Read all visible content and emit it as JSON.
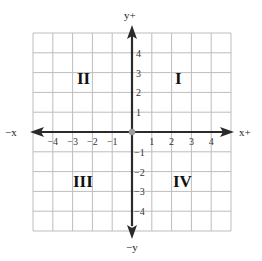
{
  "diagram": {
    "type": "coordinate-plane",
    "grid": {
      "min": -5,
      "max": 5,
      "cells": 10,
      "color": "#bdbdbd"
    },
    "axis_color": "#2b2b2b",
    "origin_color": "#9a9a9a",
    "axis_labels": {
      "x_positive": "x+",
      "x_negative": "−x",
      "y_positive": "y+",
      "y_negative": "−y"
    },
    "x_ticks": [
      {
        "value": -4,
        "label": "−4"
      },
      {
        "value": -3,
        "label": "−3"
      },
      {
        "value": -2,
        "label": "−2"
      },
      {
        "value": -1,
        "label": "−1"
      },
      {
        "value": 1,
        "label": "1"
      },
      {
        "value": 2,
        "label": "2"
      },
      {
        "value": 3,
        "label": "3"
      },
      {
        "value": 4,
        "label": "4"
      }
    ],
    "y_ticks": [
      {
        "value": 4,
        "label": "4"
      },
      {
        "value": 3,
        "label": "3"
      },
      {
        "value": 2,
        "label": "2"
      },
      {
        "value": 1,
        "label": "1"
      },
      {
        "value": -1,
        "label": "−1"
      },
      {
        "value": -2,
        "label": "−2"
      },
      {
        "value": -3,
        "label": "−3"
      },
      {
        "value": -4,
        "label": "−4"
      }
    ],
    "quadrants": [
      {
        "id": "I",
        "label": "I"
      },
      {
        "id": "II",
        "label": "II"
      },
      {
        "id": "III",
        "label": "III"
      },
      {
        "id": "IV",
        "label": "IV"
      }
    ]
  }
}
